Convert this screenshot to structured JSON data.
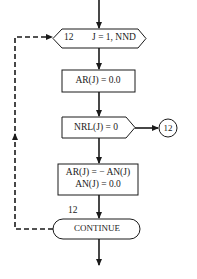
{
  "flowchart": {
    "loop_start": {
      "label_number": "12",
      "statement": "J = 1, NND"
    },
    "step1": {
      "statement": "AR(J) = 0.0"
    },
    "decision": {
      "statement": "NRL(J) = 0",
      "branch_connector": "12"
    },
    "step2": {
      "line1": "AR(J) = − AN(J)",
      "line2": "AN(J) = 0.0"
    },
    "loop_end": {
      "label_number": "12",
      "statement": "CONTINUE"
    }
  },
  "colors": {
    "stroke": "#1a1a1a",
    "background": "#ffffff"
  }
}
